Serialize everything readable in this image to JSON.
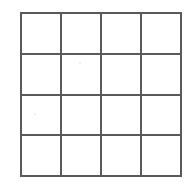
{
  "diagram": {
    "type": "grid",
    "rows": 4,
    "columns": 4,
    "cell_count": 16,
    "line_color": "#5a5a5a",
    "cell_fill_color": "#ffffff",
    "background_color": "#ffffff",
    "line_width_px": 2,
    "bounds": {
      "left": 20,
      "top": 12,
      "right": 182,
      "bottom": 177,
      "width": 162,
      "height": 165
    },
    "vertical_line_x": [
      20,
      61,
      101,
      141,
      182
    ],
    "horizontal_line_y": [
      12,
      52,
      93,
      135,
      177
    ],
    "cells": [
      {
        "row": 1,
        "column": 1,
        "label": ""
      },
      {
        "row": 1,
        "column": 2,
        "label": ""
      },
      {
        "row": 1,
        "column": 3,
        "label": ""
      },
      {
        "row": 1,
        "column": 4,
        "label": ""
      },
      {
        "row": 2,
        "column": 1,
        "label": ""
      },
      {
        "row": 2,
        "column": 2,
        "label": ""
      },
      {
        "row": 2,
        "column": 3,
        "label": ""
      },
      {
        "row": 2,
        "column": 4,
        "label": ""
      },
      {
        "row": 3,
        "column": 1,
        "label": ""
      },
      {
        "row": 3,
        "column": 2,
        "label": ""
      },
      {
        "row": 3,
        "column": 3,
        "label": ""
      },
      {
        "row": 3,
        "column": 4,
        "label": ""
      },
      {
        "row": 4,
        "column": 1,
        "label": ""
      },
      {
        "row": 4,
        "column": 2,
        "label": ""
      },
      {
        "row": 4,
        "column": 3,
        "label": ""
      },
      {
        "row": 4,
        "column": 4,
        "label": ""
      }
    ]
  }
}
